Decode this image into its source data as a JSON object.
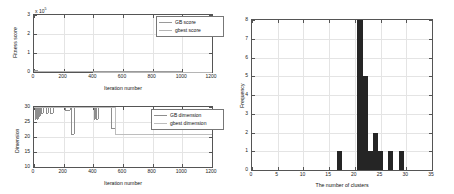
{
  "figure": {
    "panels": [
      "fitness-score-plot",
      "dimension-plot",
      "cluster-histogram"
    ]
  },
  "chart_data": [
    {
      "id": "fitness-score-plot",
      "type": "line",
      "title": "",
      "xlabel": "Iteration number",
      "ylabel": "Fitness score",
      "y_exponent_label": "x 10",
      "y_exponent_power": "5",
      "xlim": [
        0,
        1200
      ],
      "ylim": [
        0,
        3
      ],
      "xticks": [
        0,
        200,
        400,
        600,
        800,
        1000,
        1200
      ],
      "xticklabels": [
        "0",
        "200",
        "400",
        "600",
        "800",
        "1000",
        "1200"
      ],
      "yticks": [
        0,
        1,
        2,
        3
      ],
      "yticklabels": [
        "0",
        "1",
        "2",
        "3"
      ],
      "grid": true,
      "legend_position": "upper right",
      "series": [
        {
          "name": "GB score",
          "color": "#9a9a9a",
          "x": [
            0,
            20,
            60,
            150,
            400,
            700,
            1000,
            1200
          ],
          "values": [
            0.085,
            0.05,
            0.035,
            0.03,
            0.028,
            0.027,
            0.026,
            0.026
          ]
        },
        {
          "name": "gbest score",
          "color": "#b5b5b5",
          "x": [
            0,
            20,
            60,
            150,
            400,
            700,
            1000,
            1200
          ],
          "values": [
            0.07,
            0.04,
            0.03,
            0.027,
            0.026,
            0.025,
            0.025,
            0.025
          ]
        }
      ]
    },
    {
      "id": "dimension-plot",
      "type": "line",
      "title": "",
      "xlabel": "Iteration number",
      "ylabel": "Dimension",
      "xlim": [
        0,
        1200
      ],
      "ylim": [
        10,
        30
      ],
      "xticks": [
        0,
        200,
        400,
        600,
        800,
        1000,
        1200
      ],
      "xticklabels": [
        "0",
        "200",
        "400",
        "600",
        "800",
        "1000",
        "1200"
      ],
      "yticks": [
        10,
        15,
        20,
        25,
        30
      ],
      "yticklabels": [
        "10",
        "15",
        "20",
        "25",
        "30"
      ],
      "grid": true,
      "legend_position": "upper right",
      "series": [
        {
          "name": "GB dimension",
          "color": "#8d8d8d",
          "x": [
            0,
            8,
            14,
            20,
            26,
            32,
            38,
            46,
            60,
            78,
            96,
            110,
            128,
            150,
            182,
            210,
            240,
            252,
            258,
            268,
            300,
            340,
            395,
            404,
            412,
            418,
            430,
            520,
            545,
            1000,
            1200
          ],
          "values": [
            30,
            26,
            30,
            26,
            30,
            27,
            30,
            28,
            30,
            28,
            30,
            28,
            30,
            30,
            30,
            29,
            30,
            21,
            21,
            30,
            30,
            30,
            30,
            26,
            30,
            26,
            30,
            23,
            21,
            21,
            21
          ]
        },
        {
          "name": "gbest dimension",
          "color": "#bdbdbd",
          "x": [
            0,
            30,
            60,
            200,
            420,
            545,
            1000,
            1200
          ],
          "values": [
            30,
            30,
            30,
            30,
            30,
            21,
            21,
            21
          ]
        }
      ]
    },
    {
      "id": "cluster-histogram",
      "type": "bar",
      "title": "",
      "xlabel": "The number of clusters",
      "ylabel": "Frequency",
      "xlim": [
        0,
        35
      ],
      "ylim": [
        0,
        8
      ],
      "xticks": [
        0,
        5,
        10,
        15,
        20,
        25,
        30,
        35
      ],
      "xticklabels": [
        "0",
        "5",
        "10",
        "15",
        "20",
        "25",
        "30",
        "35"
      ],
      "yticks": [
        0,
        1,
        2,
        3,
        4,
        5,
        6,
        7,
        8
      ],
      "yticklabels": [
        "0",
        "1",
        "2",
        "3",
        "4",
        "5",
        "6",
        "7",
        "8"
      ],
      "grid": true,
      "bar_color": "#252525",
      "bar_width": 1,
      "categories": [
        17,
        21,
        22,
        23,
        24,
        25,
        27,
        29
      ],
      "values": [
        1,
        8,
        5,
        1,
        2,
        1,
        1,
        1
      ]
    }
  ]
}
